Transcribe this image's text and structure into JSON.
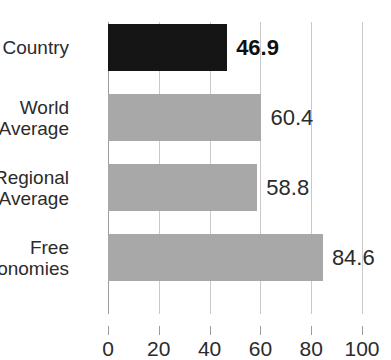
{
  "chart_data": {
    "type": "bar",
    "orientation": "horizontal",
    "title": "",
    "title_note": "cropped-off at top of image, illegible",
    "xlabel": "",
    "ylabel": "",
    "xlim": [
      0,
      100
    ],
    "xticks": [
      0,
      20,
      40,
      60,
      80,
      100
    ],
    "xtick_labels": [
      "0",
      "20",
      "40",
      "60",
      "80",
      "100"
    ],
    "grid": true,
    "legend": false,
    "categories": [
      "Country",
      "World Average",
      "Regional Average",
      "Free Economies"
    ],
    "values": [
      46.9,
      60.4,
      58.8,
      84.6
    ],
    "value_labels": [
      "46.9",
      "60.4",
      "58.8",
      "84.6"
    ],
    "bar_colors": [
      "#151515",
      "#a8a8a8",
      "#a8a8a8",
      "#a8a8a8"
    ],
    "highlight_index": 0,
    "series": [
      {
        "name": "Score",
        "values": [
          46.9,
          60.4,
          58.8,
          84.6
        ]
      }
    ],
    "bars": [
      {
        "category": "Country",
        "category_lines": [
          "Country"
        ],
        "value": 46.9,
        "label": "46.9",
        "color": "#151515",
        "bold_label": true
      },
      {
        "category": "World Average",
        "category_lines": [
          "World",
          "Average"
        ],
        "value": 60.4,
        "label": "60.4",
        "color": "#a8a8a8",
        "bold_label": false
      },
      {
        "category": "Regional Average",
        "category_lines": [
          "Regional",
          "Average"
        ],
        "value": 58.8,
        "label": "58.8",
        "color": "#a8a8a8",
        "bold_label": false
      },
      {
        "category": "Free Economies",
        "category_lines": [
          "Free",
          "Economies"
        ],
        "value": 84.6,
        "label": "84.6",
        "color": "#a8a8a8",
        "bold_label": false
      }
    ]
  },
  "colors": {
    "highlight_bar": "#151515",
    "normal_bar": "#a8a8a8",
    "text": "#2b2b2b",
    "gridline": "#c9c9c9",
    "axis": "#9b9b9b",
    "background": "#ffffff"
  }
}
